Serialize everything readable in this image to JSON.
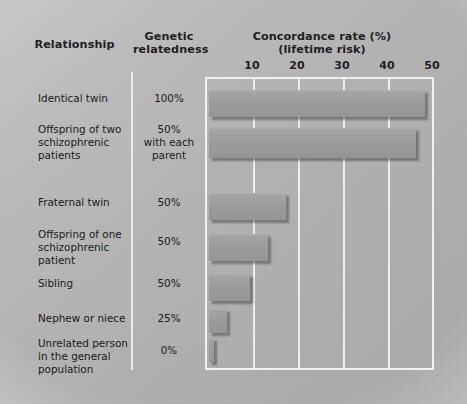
{
  "header": {
    "col_relationship": "Relationship",
    "col_genetic": "Genetic\nrelatedness",
    "col_concordance": "Concordance rate (%)\n(lifetime risk)"
  },
  "axis": {
    "ticks": [
      "10",
      "20",
      "30",
      "40",
      "50"
    ]
  },
  "rows": [
    {
      "relationship": "Identical twin",
      "genetic": "100%",
      "rate": "48"
    },
    {
      "relationship": "Offspring of two\nschizophrenic\npatients",
      "genetic": "50%\nwith each\nparent",
      "rate": "46"
    },
    {
      "relationship": "Fraternal twin",
      "genetic": "50%",
      "rate": "17"
    },
    {
      "relationship": "Offspring of one\nschizophrenic\npatient",
      "genetic": "50%",
      "rate": "13"
    },
    {
      "relationship": "Sibling",
      "genetic": "50%",
      "rate": "9"
    },
    {
      "relationship": "Nephew or niece",
      "genetic": "25%",
      "rate": "4"
    },
    {
      "relationship": "Unrelated person\nin the general\npopulation",
      "genetic": "0%",
      "rate": "1"
    }
  ],
  "colors": {
    "bar": "#9d9d9d",
    "plot_background": "#b1b1b1",
    "gridline": "#f4f4f4",
    "text": "#181818"
  },
  "chart_data": {
    "type": "bar",
    "orientation": "horizontal",
    "title": "Concordance rate (%) (lifetime risk)",
    "subtitle": "(lifetime risk)",
    "xlabel": "Concordance rate (%)",
    "ylabel": "Relationship",
    "xlim": [
      0,
      50
    ],
    "xticks": [
      10,
      20,
      30,
      40,
      50
    ],
    "grid": true,
    "legend": "none",
    "categories": [
      "Identical twin",
      "Offspring of two schizophrenic patients",
      "Fraternal twin",
      "Offspring of one schizophrenic patient",
      "Sibling",
      "Nephew or niece",
      "Unrelated person in the general population"
    ],
    "values": [
      48,
      46,
      17,
      13,
      9,
      4,
      1
    ],
    "annotations": {
      "genetic_relatedness": [
        "100%",
        "50% with each parent",
        "50%",
        "50%",
        "50%",
        "25%",
        "0%"
      ]
    }
  }
}
